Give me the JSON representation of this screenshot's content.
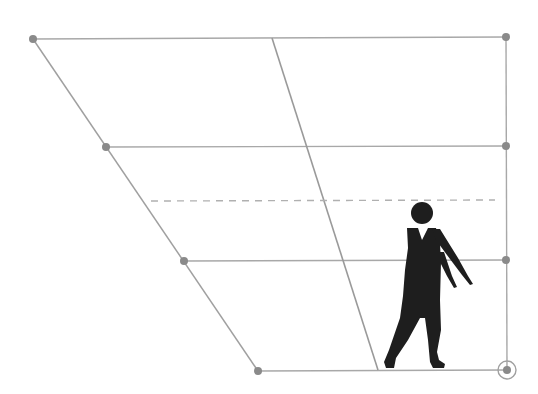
{
  "diagram": {
    "colors": {
      "background": "#ffffff",
      "line": "#a8a8a8",
      "point": "#8a8a8a",
      "figure": "#1e1e1e"
    },
    "points": {
      "left": [
        {
          "x": 33,
          "y": 39
        },
        {
          "x": 106,
          "y": 147
        },
        {
          "x": 184,
          "y": 261
        },
        {
          "x": 258,
          "y": 371
        }
      ],
      "right": [
        {
          "x": 506,
          "y": 37
        },
        {
          "x": 506,
          "y": 146
        },
        {
          "x": 506,
          "y": 260
        },
        {
          "x": 507,
          "y": 370
        }
      ]
    },
    "slanted_line": {
      "x1": 272,
      "y1": 38,
      "x2": 378,
      "y2": 370
    },
    "dashed_line": {
      "x1": 151,
      "y1": 201,
      "x2": 495,
      "y2": 200
    },
    "highlighted_point": {
      "x": 507,
      "y": 370,
      "ring_radius": 9
    },
    "figure": {
      "head": {
        "cx": 422,
        "cy": 213,
        "r": 11
      }
    }
  }
}
